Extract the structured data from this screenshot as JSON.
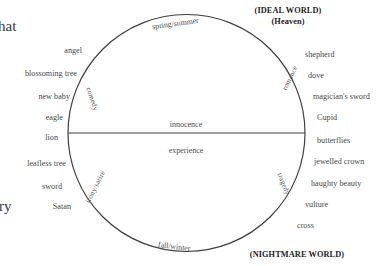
{
  "diagram": {
    "poles": {
      "top_line1": "(IDEAL WORLD)",
      "top_line2": "(Heaven)",
      "bottom": "(NIGHTMARE WORLD)"
    },
    "seasons": {
      "top": "spring/summer",
      "bottom": "fall/winter"
    },
    "axis": {
      "upper": "innocence",
      "lower": "experience"
    },
    "arcs": {
      "upper_left": "comedy",
      "upper_right": "romance",
      "lower_left": "irony/satire",
      "lower_right": "tragedy"
    },
    "left_column": {
      "upper": [
        "angel",
        "blossoming tree",
        "new baby",
        "eagle",
        "lion"
      ],
      "lower": [
        "leafless tree",
        "sword",
        "Satan"
      ]
    },
    "right_column": {
      "upper": [
        "shepherd",
        "dove",
        "magician's sword",
        "Cupid"
      ],
      "lower": [
        "butterflies",
        "jewelled crown",
        "haughty beauty",
        "vulture",
        "cross"
      ]
    },
    "cropped_text": {
      "top_left": "hat",
      "bottom_left": "ry"
    },
    "colors": {
      "stroke": "#3f3f3f",
      "text": "#484848",
      "heading": "#1d1d1d",
      "background": "#ffffff"
    }
  }
}
